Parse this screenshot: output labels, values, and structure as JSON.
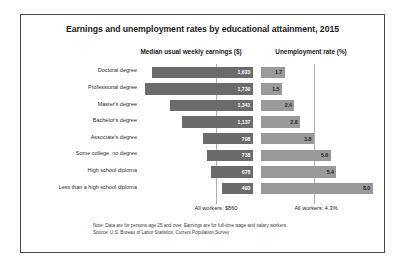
{
  "chart_data": {
    "type": "bar",
    "title": "Earnings and unemployment rates by educational attainment, 2015",
    "categories": [
      "Doctoral degree",
      "Professional degree",
      "Master's degree",
      "Bachelor's degree",
      "Associate's degree",
      "Some college, no degree",
      "High school diploma",
      "Less than a high school diploma"
    ],
    "panels": [
      {
        "name": "earnings",
        "header": "Median usual weekly earnings ($)",
        "unit": "$",
        "direction": "left",
        "values": [
          1623,
          1730,
          1341,
          1137,
          798,
          738,
          678,
          493
        ],
        "value_labels": [
          "1,623",
          "1,730",
          "1,341",
          "1,137",
          "798",
          "738",
          "678",
          "493"
        ],
        "xlim": [
          0,
          1800
        ],
        "reference_line": {
          "value": 860,
          "label": "All workers: $860"
        },
        "bar_color": "#6b6b6b",
        "label_color": "#ffffff"
      },
      {
        "name": "unemployment",
        "header": "Unemployment rate (%)",
        "unit": "%",
        "direction": "right",
        "values": [
          1.7,
          1.5,
          2.4,
          2.8,
          3.8,
          5.0,
          5.4,
          8.0
        ],
        "value_labels": [
          "1.7",
          "1.5",
          "2.4",
          "2.8",
          "3.8",
          "5.0",
          "5.4",
          "8.0"
        ],
        "xlim": [
          0,
          8.6
        ],
        "reference_line": {
          "value": 4.3,
          "label": "All workers: 4.3%"
        },
        "bar_color": "#9a9a9a",
        "label_color": "#222222"
      }
    ],
    "grid": false,
    "legend": "none",
    "notes": [
      "Note: Data are for persons age 25 and over. Earnings are for full-time wage and salary workers.",
      "Source: U.S. Bureau of Labor Statistics, Current Population Survey"
    ]
  }
}
